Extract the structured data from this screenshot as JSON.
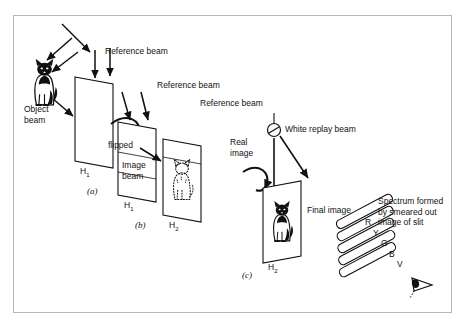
{
  "figure": {
    "background_color": "#ffffff",
    "frame_color": "#b8b8b8",
    "ink_color": "#111111"
  },
  "panels": [
    {
      "id": "a",
      "letter": "(a)",
      "plate_label": "H",
      "plate_sub": "1"
    },
    {
      "id": "b",
      "letter": "(b)",
      "plate_label": "H",
      "plate_sub": "1"
    },
    {
      "id": "c",
      "letter": "(c)",
      "plate_label": "H",
      "plate_sub": "2"
    }
  ],
  "labels": {
    "reference_beam_1": "Reference beam",
    "reference_beam_2": "Reference beam",
    "reference_beam_3": "Reference beam",
    "object_beam": "Object\nbeam",
    "flipped": "flipped",
    "image_beam": "Image\nbeam",
    "real_image": "Real\nimage",
    "white_replay_beam": "White replay beam",
    "final_image": "Final image",
    "spectrum_caption": "Spectrum formed\nby smeared out\nimage of slit",
    "plate_h1_a": "H",
    "plate_h1_a_sub": "1",
    "plate_h1_b": "H",
    "plate_h1_b_sub": "1",
    "plate_h2_b": "H",
    "plate_h2_b_sub": "2",
    "plate_h2_c": "H",
    "plate_h2_c_sub": "2"
  },
  "spectrum": {
    "bands": [
      {
        "letter": "R",
        "name": "red"
      },
      {
        "letter": "Y",
        "name": "yellow"
      },
      {
        "letter": "G",
        "name": "green"
      },
      {
        "letter": "B",
        "name": "blue"
      },
      {
        "letter": "V",
        "name": "violet"
      }
    ]
  },
  "icons": {
    "object_cat": "cat-silhouette-icon",
    "real_image_cat": "dashed-cat-icon",
    "final_cat": "cat-silhouette-icon",
    "slit_source": "slit-source-icon",
    "observer_eye": "eye-icon",
    "flip_arrow": "rotate-arrow-icon"
  }
}
